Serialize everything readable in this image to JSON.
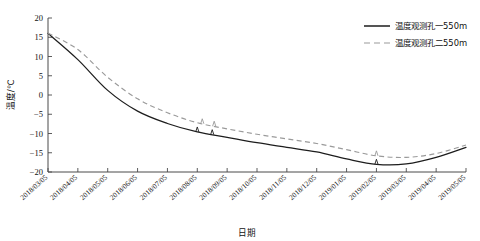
{
  "chart_data": {
    "type": "line",
    "title": "",
    "xlabel": "日期",
    "ylabel": "温度/℃",
    "ylim": [
      -20,
      20
    ],
    "ytick_step": 5,
    "yticks": [
      20,
      15,
      10,
      5,
      0,
      -5,
      -10,
      -15,
      -20
    ],
    "grid": false,
    "legend_position": "top-right",
    "categories": [
      "2018/03/05",
      "2018/04/05",
      "2018/05/05",
      "2018/06/05",
      "2018/07/05",
      "2018/08/05",
      "2018/09/05",
      "2018/10/05",
      "2018/11/05",
      "2018/12/05",
      "2019/01/05",
      "2019/02/05",
      "2019/03/05",
      "2019/04/05",
      "2019/05/05"
    ],
    "series": [
      {
        "name": "温度观测孔一550m",
        "style": "solid",
        "color": "#1d1d1d",
        "values": [
          16.0,
          9.2,
          1.2,
          -4.2,
          -7.4,
          -9.6,
          -11.0,
          -12.4,
          -13.6,
          -14.8,
          -16.6,
          -18.0,
          -17.9,
          -16.2,
          -13.6
        ]
      },
      {
        "name": "温度观测孔二550m",
        "style": "dashed",
        "color": "#9a9a9a",
        "values": [
          16.1,
          11.8,
          4.6,
          -1.0,
          -4.6,
          -7.2,
          -8.8,
          -10.2,
          -11.4,
          -12.6,
          -14.2,
          -15.8,
          -16.2,
          -15.2,
          -13.0
        ]
      }
    ],
    "annotations": [
      {
        "label": "spike",
        "series": "温度观测孔一550m",
        "near": "2018/08/05"
      },
      {
        "label": "spike",
        "series": "温度观测孔一550m",
        "near": "2018/08/20"
      },
      {
        "label": "spike",
        "series": "温度观测孔二550m",
        "near": "2018/08/10"
      },
      {
        "label": "spike",
        "series": "温度观测孔二550m",
        "near": "2018/08/22"
      },
      {
        "label": "spike",
        "series": "温度观测孔一550m",
        "near": "2019/02/05"
      },
      {
        "label": "spike",
        "series": "温度观测孔二550m",
        "near": "2019/02/05"
      }
    ]
  },
  "legend": {
    "items": [
      {
        "label": "温度观测孔一550m"
      },
      {
        "label": "温度观测孔二550m"
      }
    ]
  }
}
